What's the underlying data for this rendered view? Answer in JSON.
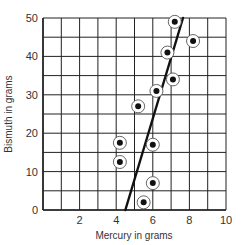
{
  "chart_data": {
    "type": "scatter",
    "title": "",
    "xlabel": "Mercury in grams",
    "ylabel": "Bismuth in grams",
    "xlim": [
      0,
      10
    ],
    "ylim": [
      0,
      50
    ],
    "xticks": [
      2,
      4,
      6,
      8,
      10
    ],
    "yticks": [
      0,
      10,
      20,
      30,
      40,
      50
    ],
    "grid": true,
    "grid_x_step": 1,
    "grid_y_step": 5,
    "legend": null,
    "series": [
      {
        "name": "Measurements",
        "marker": "circled-dot",
        "points": [
          {
            "x": 7.2,
            "y": 49
          },
          {
            "x": 8.2,
            "y": 44
          },
          {
            "x": 6.8,
            "y": 41
          },
          {
            "x": 7.1,
            "y": 34
          },
          {
            "x": 6.2,
            "y": 31
          },
          {
            "x": 5.2,
            "y": 27
          },
          {
            "x": 4.2,
            "y": 17.5
          },
          {
            "x": 6.0,
            "y": 17
          },
          {
            "x": 4.2,
            "y": 12.5
          },
          {
            "x": 6.0,
            "y": 7
          },
          {
            "x": 5.5,
            "y": 2
          }
        ]
      }
    ],
    "fit_line": {
      "name": "Best-fit line",
      "from": {
        "x": 4.5,
        "y": 0
      },
      "to": {
        "x": 7.65,
        "y": 50
      }
    }
  },
  "colors": {
    "grid": "#222222",
    "points": "#111111",
    "line": "#111111",
    "background": "#ffffff"
  }
}
